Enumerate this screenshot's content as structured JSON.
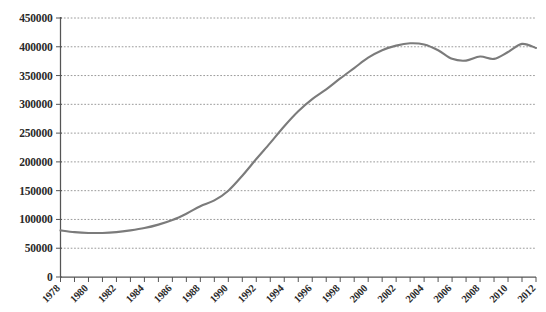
{
  "chart_data": {
    "type": "line",
    "title": "",
    "subtitle": "",
    "xlabel": "",
    "ylabel": "",
    "grid": true,
    "legend": false,
    "legend_position": "none",
    "line_color": "#7b7b7b",
    "grid_color": "#8f8f8f",
    "axis_color": "#555555",
    "background_color": "#ffffff",
    "xlim": [
      1978,
      2012
    ],
    "ylim": [
      0,
      450000
    ],
    "y_tick_step": 50000,
    "x_tick_step": 1,
    "x_label_step": 2,
    "y_tick_labels": [
      "0",
      "50000",
      "100000",
      "150000",
      "200000",
      "250000",
      "300000",
      "350000",
      "400000",
      "450000"
    ],
    "y_ticks": [
      0,
      50000,
      100000,
      150000,
      200000,
      250000,
      300000,
      350000,
      400000,
      450000
    ],
    "x_tick_labels": [
      "1978",
      "1980",
      "1982",
      "1984",
      "1986",
      "1988",
      "1990",
      "1992",
      "1994",
      "1996",
      "1998",
      "2000",
      "2002",
      "2004",
      "2006",
      "2008",
      "2010",
      "2012"
    ],
    "x_ticks": [
      1978,
      1979,
      1980,
      1981,
      1982,
      1983,
      1984,
      1985,
      1986,
      1987,
      1988,
      1989,
      1990,
      1991,
      1992,
      1993,
      1994,
      1995,
      1996,
      1997,
      1998,
      1999,
      2000,
      2001,
      2002,
      2003,
      2004,
      2005,
      2006,
      2007,
      2008,
      2009,
      2010,
      2011,
      2012
    ],
    "x": [
      1978,
      1979,
      1980,
      1981,
      1982,
      1983,
      1984,
      1985,
      1986,
      1987,
      1988,
      1989,
      1990,
      1991,
      1992,
      1993,
      1994,
      1995,
      1996,
      1997,
      1998,
      1999,
      2000,
      2001,
      2002,
      2003,
      2004,
      2005,
      2006,
      2007,
      2008,
      2009,
      2010,
      2011,
      2012
    ],
    "values": [
      81000,
      78000,
      76500,
      76500,
      78000,
      81000,
      85000,
      91000,
      99000,
      110000,
      123000,
      133000,
      150000,
      176000,
      205000,
      233000,
      262000,
      288000,
      309000,
      326000,
      345000,
      363000,
      381000,
      394000,
      402000,
      406000,
      404000,
      394000,
      379000,
      376000,
      383000,
      379000,
      391000,
      405000,
      398000
    ],
    "x_label_rotation": -45
  }
}
